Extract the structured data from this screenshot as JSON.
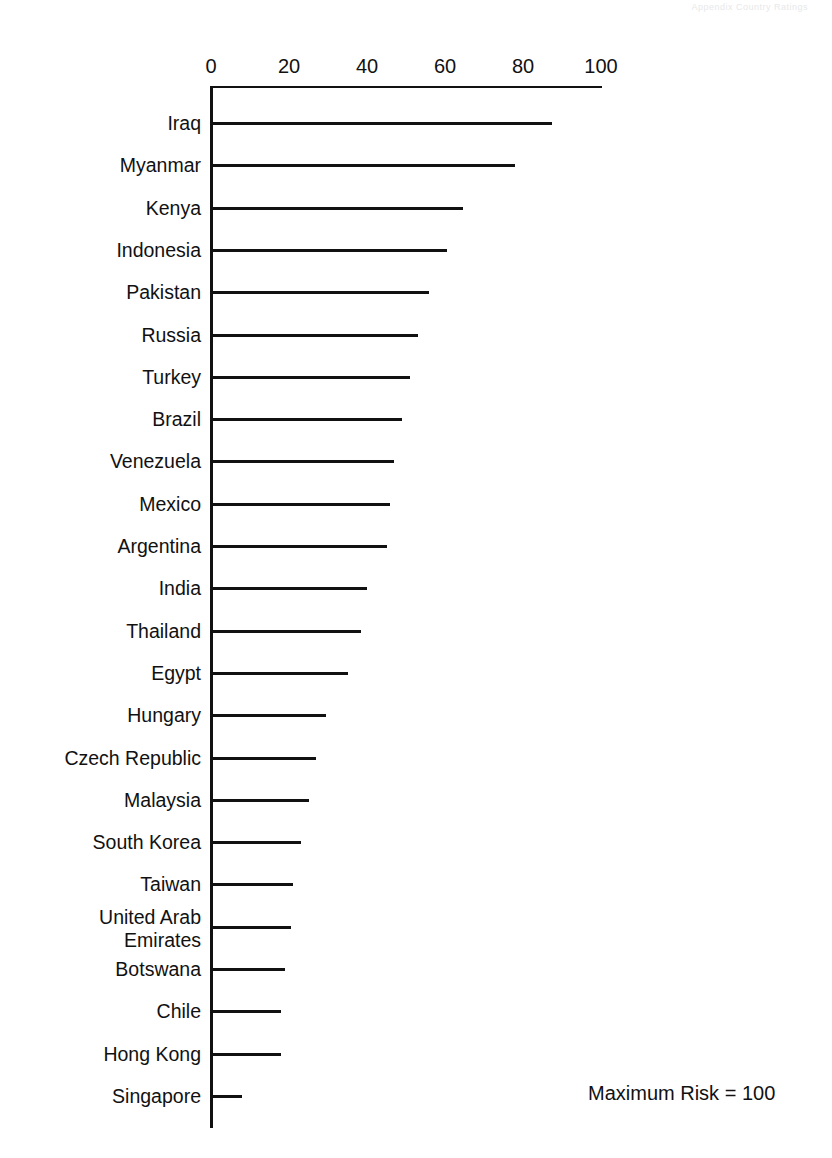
{
  "scan_artifact": {
    "header_text": "Appendix   Country Ratings"
  },
  "chart_data": {
    "type": "bar",
    "orientation": "horizontal",
    "title": "",
    "xlabel": "",
    "ylabel": "",
    "xlim": [
      0,
      100
    ],
    "xticks": [
      0,
      20,
      40,
      60,
      80,
      100
    ],
    "xtick_labels": [
      "0",
      "20",
      "40",
      "60",
      "80",
      "100"
    ],
    "grid": false,
    "legend": null,
    "annotation": "Maximum Risk = 100",
    "categories": [
      "Iraq",
      "Myanmar",
      "Kenya",
      "Indonesia",
      "Pakistan",
      "Russia",
      "Turkey",
      "Brazil",
      "Venezuela",
      "Mexico",
      "Argentina",
      "India",
      "Thailand",
      "Egypt",
      "Hungary",
      "Czech Republic",
      "Malaysia",
      "South Korea",
      "Taiwan",
      "United Arab\nEmirates",
      "Botswana",
      "Chile",
      "Hong Kong",
      "Singapore"
    ],
    "values": [
      87.5,
      78,
      64.5,
      60.5,
      56,
      53,
      51,
      49,
      47,
      46,
      45,
      40,
      38.5,
      35,
      29.5,
      27,
      25,
      23,
      21,
      20.5,
      19,
      18,
      18,
      8
    ]
  }
}
